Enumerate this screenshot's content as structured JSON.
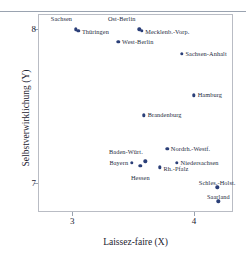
{
  "chart_data": {
    "type": "scatter",
    "title": "",
    "xlabel": "Laissez-faire (X)",
    "ylabel": "Selbstverwirklichung (Y)",
    "xlim": [
      2.72,
      4.32
    ],
    "ylim": [
      6.81,
      8.1
    ],
    "xticks": [
      3,
      4
    ],
    "xticklabels": [
      "3",
      "4"
    ],
    "yticks": [
      7,
      8
    ],
    "yticklabels": [
      "7",
      "8"
    ],
    "grid": false,
    "legend": null,
    "marker_color": "#2b3f78",
    "points": [
      {
        "label": "Sachsen",
        "x": 3.03,
        "y": 8.0,
        "lx": 3.0,
        "ly": 8.07,
        "anchor": "l"
      },
      {
        "label": "Thüringen",
        "x": 3.05,
        "y": 7.99,
        "lx": 3.08,
        "ly": 7.98,
        "anchor": "r"
      },
      {
        "label": "Ost-Berlin",
        "x": 3.55,
        "y": 8.0,
        "lx": 3.52,
        "ly": 8.07,
        "anchor": "l"
      },
      {
        "label": "Mecklenb.-Vorp.",
        "x": 3.57,
        "y": 7.99,
        "lx": 3.6,
        "ly": 7.98,
        "anchor": "r"
      },
      {
        "label": "West-Berlin",
        "x": 3.38,
        "y": 7.92,
        "lx": 3.41,
        "ly": 7.92,
        "anchor": "r"
      },
      {
        "label": "Sachsen-Anhalt",
        "x": 3.9,
        "y": 7.84,
        "lx": 3.93,
        "ly": 7.84,
        "anchor": "r"
      },
      {
        "label": "Hamburg",
        "x": 4.0,
        "y": 7.57,
        "lx": 4.03,
        "ly": 7.57,
        "anchor": "r"
      },
      {
        "label": "Brandenburg",
        "x": 3.59,
        "y": 7.44,
        "lx": 3.62,
        "ly": 7.44,
        "anchor": "r"
      },
      {
        "label": "Nordrh.-Westf.",
        "x": 3.78,
        "y": 7.22,
        "lx": 3.81,
        "ly": 7.22,
        "anchor": "r"
      },
      {
        "label": "Baden-Würt.",
        "x": 3.6,
        "y": 7.14,
        "lx": 3.58,
        "ly": 7.2,
        "anchor": "l"
      },
      {
        "label": "Bayern",
        "x": 3.49,
        "y": 7.13,
        "lx": 3.46,
        "ly": 7.13,
        "anchor": "l"
      },
      {
        "label": "Niedersachsen",
        "x": 3.86,
        "y": 7.13,
        "lx": 3.89,
        "ly": 7.13,
        "anchor": "r"
      },
      {
        "label": "Hessen",
        "x": 3.56,
        "y": 7.11,
        "lx": 3.56,
        "ly": 7.05,
        "anchor": "c"
      },
      {
        "label": "Rh.-Pfalz",
        "x": 3.72,
        "y": 7.1,
        "lx": 3.75,
        "ly": 7.09,
        "anchor": "r"
      },
      {
        "label": "Schles.-Holst.",
        "x": 4.19,
        "y": 6.97,
        "lx": 4.19,
        "ly": 7.02,
        "anchor": "c"
      },
      {
        "label": "Saarland",
        "x": 4.2,
        "y": 6.88,
        "lx": 4.2,
        "ly": 6.93,
        "anchor": "c"
      }
    ]
  }
}
